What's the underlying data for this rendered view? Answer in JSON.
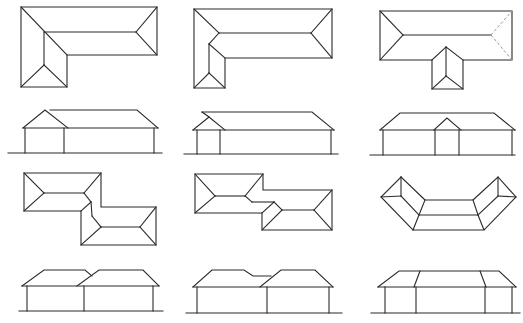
{
  "diagram": {
    "type": "roof-plan-and-elevation-catalog",
    "layout": {
      "rows": 4,
      "columns": 3
    },
    "stroke_color": "#2a2a2a",
    "dashed_color": "#9a9a9a",
    "background": "#ffffff",
    "figures": [
      {
        "id": "l-shape-plan",
        "row": 1,
        "col": 1,
        "kind": "plan",
        "shape": "L-shaped hip roof"
      },
      {
        "id": "l-shape-offset-plan",
        "row": 1,
        "col": 2,
        "kind": "plan",
        "shape": "L-shaped hip roof, narrow wing"
      },
      {
        "id": "t-shape-plan",
        "row": 1,
        "col": 3,
        "kind": "plan",
        "shape": "T-shaped hip roof with dashed hip"
      },
      {
        "id": "l-shape-elevation",
        "row": 2,
        "col": 1,
        "kind": "elevation",
        "shape": "gable wing + hip main"
      },
      {
        "id": "l-shape-offset-elevation",
        "row": 2,
        "col": 2,
        "kind": "elevation",
        "shape": "small gable wing + hip main"
      },
      {
        "id": "t-shape-elevation",
        "row": 2,
        "col": 3,
        "kind": "elevation",
        "shape": "centered gable + hip main"
      },
      {
        "id": "z-shape-plan",
        "row": 3,
        "col": 1,
        "kind": "plan",
        "shape": "stepped (Z) hip roof"
      },
      {
        "id": "z-shape-wide-plan",
        "row": 3,
        "col": 2,
        "kind": "plan",
        "shape": "stepped hip roof with link"
      },
      {
        "id": "u-shape-plan",
        "row": 3,
        "col": 3,
        "kind": "plan",
        "shape": "angled (U/boomerang) hip roof"
      },
      {
        "id": "z-shape-elevation",
        "row": 4,
        "col": 1,
        "kind": "elevation",
        "shape": "two overlapping hips"
      },
      {
        "id": "z-shape-wide-elevation",
        "row": 4,
        "col": 2,
        "kind": "elevation",
        "shape": "two hips with lowered link"
      },
      {
        "id": "u-shape-elevation",
        "row": 4,
        "col": 3,
        "kind": "elevation",
        "shape": "three-part hip"
      }
    ]
  }
}
